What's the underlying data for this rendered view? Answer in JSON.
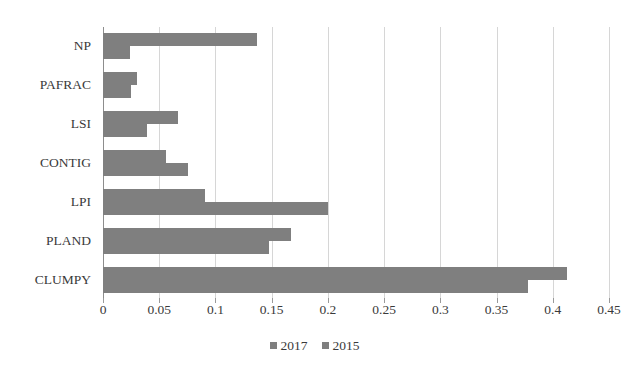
{
  "chart_data": {
    "type": "bar",
    "orientation": "horizontal",
    "title": "",
    "subtitle": "",
    "xlabel": "",
    "ylabel": "",
    "xlim": [
      0,
      0.45
    ],
    "xticks": [
      "0",
      "0.05",
      "0.1",
      "0.15",
      "0.2",
      "0.25",
      "0.3",
      "0.35",
      "0.4",
      "0.45"
    ],
    "xtick_values": [
      0,
      0.05,
      0.1,
      0.15,
      0.2,
      0.25,
      0.3,
      0.35,
      0.4,
      0.45
    ],
    "grid": "vertical",
    "legend_position": "bottom-center",
    "categories": [
      "NP",
      "PAFRAC",
      "LSI",
      "CONTIG",
      "LPI",
      "PLAND",
      "CLUMPY"
    ],
    "series": [
      {
        "name": "2017",
        "color": "#7f7f7f",
        "values": [
          0.137,
          0.03,
          0.067,
          0.056,
          0.091,
          0.167,
          0.413
        ]
      },
      {
        "name": "2015",
        "color": "#7f7f7f",
        "values": [
          0.024,
          0.025,
          0.039,
          0.076,
          0.2,
          0.148,
          0.378
        ]
      }
    ],
    "annotations": []
  },
  "legend": {
    "items": [
      {
        "label": "2017",
        "swatch_name": "legend-swatch-2017"
      },
      {
        "label": "2015",
        "swatch_name": "legend-swatch-2015"
      }
    ]
  },
  "colors": {
    "bar": "#7f7f7f",
    "gridline": "#d6d6d6",
    "axis": "#8d8d8d",
    "text": "#3a3a3a",
    "background": "#ffffff"
  }
}
